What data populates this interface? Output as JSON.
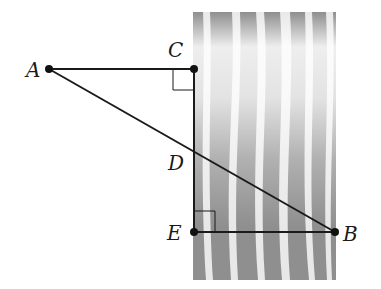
{
  "diagram": {
    "type": "geometry-river-width",
    "points": [
      {
        "id": "A",
        "label": "A",
        "x": 49,
        "y": 69,
        "lx": 26,
        "ly": 77
      },
      {
        "id": "C",
        "label": "C",
        "x": 194,
        "y": 69,
        "lx": 168,
        "ly": 57
      },
      {
        "id": "D",
        "label": "D",
        "x": 194,
        "y": 149,
        "lx": 168,
        "ly": 170
      },
      {
        "id": "E",
        "label": "E",
        "x": 194,
        "y": 232,
        "lx": 167,
        "ly": 240
      },
      {
        "id": "B",
        "label": "B",
        "x": 335,
        "y": 232,
        "lx": 343,
        "ly": 241
      }
    ],
    "segments": [
      "AC",
      "CE",
      "EB",
      "AB"
    ],
    "right_angles": [
      "C",
      "E"
    ],
    "river": {
      "x": 193,
      "y": 12,
      "width": 143,
      "height": 268,
      "color_dark": "#8f8f8f",
      "color_light": "#e6e6e6"
    },
    "colors": {
      "line": "#1a1a1a",
      "point": "#111111"
    }
  }
}
